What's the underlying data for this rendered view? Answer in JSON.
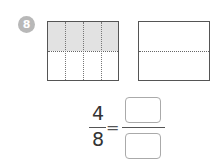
{
  "problem": {
    "number": "8",
    "fraction": {
      "numerator": "4",
      "denominator": "8",
      "equals": "="
    },
    "answer": {
      "numerator": "",
      "denominator": ""
    },
    "left_figure": {
      "columns": 4,
      "rows": 2,
      "shaded_parts": 4
    },
    "right_figure": {
      "rows": 2,
      "shaded_parts": 0
    },
    "colors": {
      "shade": "#e2e2e2",
      "badge": "#b8b8b8"
    }
  }
}
